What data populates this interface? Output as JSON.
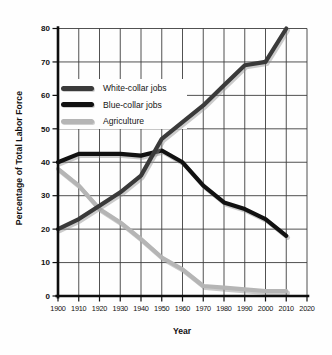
{
  "chart_data": {
    "type": "line",
    "title": "",
    "xlabel": "Year",
    "ylabel": "Percentage of Total Labor Force",
    "xlim": [
      1900,
      2020
    ],
    "ylim": [
      0,
      80
    ],
    "x_ticks": [
      1900,
      1910,
      1920,
      1930,
      1940,
      1950,
      1960,
      1970,
      1980,
      1990,
      2000,
      2010,
      2020
    ],
    "y_ticks": [
      0,
      10,
      20,
      30,
      40,
      50,
      60,
      70,
      80
    ],
    "grid": true,
    "legend_position": "upper-left-inside",
    "categories": [
      1900,
      1910,
      1920,
      1930,
      1940,
      1950,
      1960,
      1970,
      1980,
      1990,
      2000,
      2010
    ],
    "series": [
      {
        "name": "Agriculture",
        "color": "#b5b5b5",
        "values": [
          38,
          33,
          26,
          22,
          17,
          11.5,
          8,
          3,
          2.5,
          2,
          1.5,
          1.5
        ]
      },
      {
        "name": "Blue-collar jobs",
        "color": "#111111",
        "values": [
          40,
          42.5,
          42.5,
          42.5,
          42,
          43.5,
          40,
          33,
          28,
          26,
          23,
          18
        ]
      },
      {
        "name": "White-collar jobs",
        "color": "#3a3a3a",
        "values": [
          20,
          23,
          27,
          31,
          36,
          47,
          52,
          57,
          63,
          69,
          70,
          80
        ]
      }
    ],
    "legend_order": [
      "White-collar jobs",
      "Blue-collar jobs",
      "Agriculture"
    ]
  }
}
